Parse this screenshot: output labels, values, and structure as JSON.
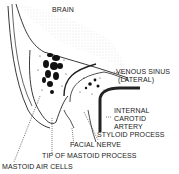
{
  "diagram": {
    "labels": {
      "brain": "BRAIN",
      "venous_sinus_1": "VENOUS SINUS",
      "venous_sinus_2": "(LATERAL)",
      "internal_carotid_1": "INTERNAL",
      "internal_carotid_2": "CAROTID",
      "internal_carotid_3": "ARTERY",
      "styloid": "STYLOID PROCESS",
      "facial_nerve": "FACIAL NERVE",
      "tip_mastoid": "TIP OF MASTOID PROCESS",
      "mastoid_air_cells": "MASTOID AIR CELLS"
    },
    "colors": {
      "ink": "#222222",
      "stipple": "#bbbbbb",
      "background": "#ffffff"
    }
  }
}
